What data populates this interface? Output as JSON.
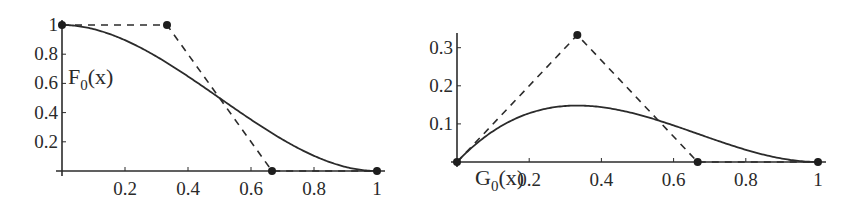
{
  "chart_data": [
    {
      "type": "line",
      "title": "",
      "function_label": {
        "name": "F",
        "subscript": "0",
        "arg": "(x)"
      },
      "xlabel": "",
      "ylabel": "",
      "xlim": [
        0,
        1
      ],
      "ylim": [
        0,
        1
      ],
      "x_ticks": [
        0.2,
        0.4,
        0.6,
        0.8,
        1
      ],
      "x_tick_labels": [
        "0.2",
        "0.4",
        "0.6",
        "0.8",
        "1"
      ],
      "y_ticks": [
        0.2,
        0.4,
        0.6,
        0.8,
        1
      ],
      "y_tick_labels": [
        "0.2",
        "0.4",
        "0.6",
        "0.8",
        "1"
      ],
      "grid": false,
      "series": [
        {
          "name": "F0(x)",
          "style": "solid",
          "formula": "(1-x)^2*(1+2x)",
          "x": [
            0,
            0.1,
            0.2,
            0.3,
            0.4,
            0.5,
            0.6,
            0.7,
            0.8,
            0.9,
            1
          ],
          "y": [
            1,
            0.972,
            0.896,
            0.784,
            0.648,
            0.5,
            0.352,
            0.216,
            0.104,
            0.028,
            0
          ]
        },
        {
          "name": "control polygon",
          "style": "dashed",
          "x": [
            0,
            0.3333,
            0.6667,
            1
          ],
          "y": [
            1,
            1,
            0,
            0
          ],
          "markers": true
        }
      ]
    },
    {
      "type": "line",
      "title": "",
      "function_label": {
        "name": "G",
        "subscript": "0",
        "arg": "(x)"
      },
      "xlabel": "",
      "ylabel": "",
      "xlim": [
        0,
        1
      ],
      "ylim": [
        0,
        0.35
      ],
      "x_ticks": [
        0.2,
        0.4,
        0.6,
        0.8,
        1
      ],
      "x_tick_labels": [
        "0.2",
        "0.4",
        "0.6",
        "0.8",
        "1"
      ],
      "y_ticks": [
        0.1,
        0.2,
        0.3
      ],
      "y_tick_labels": [
        "0.1",
        "0.2",
        "0.3"
      ],
      "grid": false,
      "series": [
        {
          "name": "G0(x)",
          "style": "solid",
          "formula": "x*(1-x)^2",
          "x": [
            0,
            0.1,
            0.2,
            0.3,
            0.3333,
            0.4,
            0.5,
            0.6,
            0.7,
            0.8,
            0.9,
            1
          ],
          "y": [
            0,
            0.081,
            0.128,
            0.147,
            0.148,
            0.144,
            0.125,
            0.096,
            0.063,
            0.032,
            0.009,
            0
          ]
        },
        {
          "name": "control polygon",
          "style": "dashed",
          "x": [
            0,
            0.3333,
            0.6667,
            1
          ],
          "y": [
            0,
            0.3333,
            0,
            0
          ],
          "markers": true
        }
      ]
    }
  ]
}
